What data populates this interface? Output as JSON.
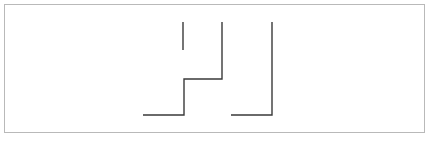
{
  "figure": {
    "title": "",
    "background_color": "#ffffff",
    "frame": {
      "name": "outer-frame",
      "x": 4,
      "y": 4,
      "width": 421,
      "height": 129,
      "stroke_color": "#b9b9b9",
      "stroke_width": 1,
      "fill_color": "#ffffff"
    },
    "line_style": {
      "stroke_color": "#3a3a3a",
      "stroke_width": 1.4,
      "line_cap": "butt",
      "line_join": "miter"
    },
    "shapes": [
      {
        "name": "vertical-stub-segment",
        "type": "polyline",
        "points": "183,22 183,50",
        "description": "short free-standing vertical tick at top left of figure"
      },
      {
        "name": "stepped-polyline",
        "type": "polyline",
        "points": "222,22 222,79 184,79 184,115 143,115",
        "description": "stepped Z-shaped wall running from top center down and left to bottom"
      },
      {
        "name": "right-l-polyline",
        "type": "polyline",
        "points": "272,22 272,115 231,115",
        "description": "L-shaped wall: vertical from top dropping to bottom then left"
      }
    ]
  }
}
